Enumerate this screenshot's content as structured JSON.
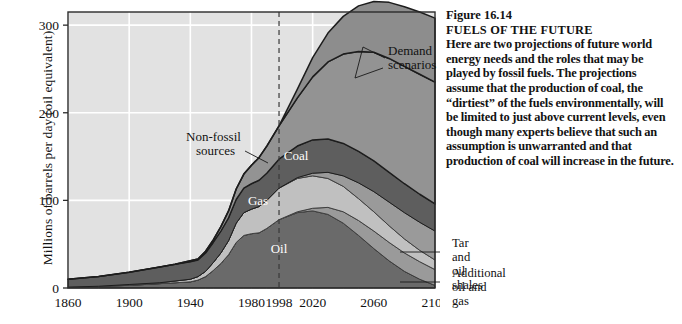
{
  "chart_data": {
    "type": "area",
    "title": "FUELS OF THE FUTURE",
    "figure_number": "Figure 16.14",
    "xlabel": "",
    "ylabel": "Millions of barrels per day (oil equivalent)",
    "xlim": [
      1860,
      2100
    ],
    "ylim": [
      0,
      315
    ],
    "yticks": [
      0,
      100,
      200,
      300
    ],
    "ytick_labels": [
      "0",
      "100",
      "200",
      "300"
    ],
    "xticks": [
      1860,
      1900,
      1940,
      1980,
      1998,
      2020,
      2060,
      2100
    ],
    "xtick_labels": [
      "1860",
      "1900",
      "1940",
      "1980",
      "1998",
      "2020",
      "2060",
      "2100"
    ],
    "grid": true,
    "grid_color": "#ffffff",
    "plot_background": "#e2e2e2",
    "present_year_marker": 1998,
    "present_marker_style": "dashed",
    "legend_position": "in-plot labels",
    "x": [
      1860,
      1880,
      1900,
      1920,
      1930,
      1940,
      1945,
      1950,
      1955,
      1960,
      1965,
      1970,
      1975,
      1980,
      1985,
      1990,
      1998,
      2010,
      2020,
      2030,
      2040,
      2050,
      2060,
      2070,
      2080,
      2090,
      2100
    ],
    "series": [
      {
        "name": "Oil",
        "color": "#6a6a6a",
        "label_in_plot": "Oil",
        "values": [
          1,
          2,
          3,
          5,
          6,
          7,
          9,
          13,
          20,
          28,
          38,
          52,
          60,
          62,
          63,
          68,
          78,
          86,
          88,
          84,
          74,
          60,
          45,
          31,
          19,
          10,
          3
        ]
      },
      {
        "name": "Additional oil and gas",
        "color": "#9a9a9a",
        "label_in_plot": "",
        "annotation": "Additional oil and gas",
        "values": [
          0,
          0,
          0,
          0,
          0,
          0,
          0,
          0,
          0,
          0,
          0,
          0,
          0,
          0,
          0,
          0,
          0,
          1,
          3,
          8,
          13,
          17,
          20,
          21,
          21,
          20,
          18
        ]
      },
      {
        "name": "Gas",
        "color": "#c0c0c0",
        "label_in_plot": "Gas",
        "values": [
          0,
          0,
          1,
          1,
          2,
          3,
          4,
          6,
          9,
          12,
          16,
          22,
          26,
          28,
          30,
          32,
          36,
          38,
          37,
          33,
          29,
          25,
          22,
          19,
          16,
          13,
          11
        ]
      },
      {
        "name": "Tar and oil shales",
        "color": "#9a9a9a",
        "label_in_plot": "",
        "annotation": "Tar and oil shales",
        "values": [
          0,
          0,
          0,
          0,
          0,
          0,
          0,
          0,
          0,
          0,
          0,
          0,
          0,
          0,
          0,
          0,
          0,
          1,
          3,
          7,
          12,
          18,
          23,
          27,
          30,
          32,
          33
        ]
      },
      {
        "name": "Coal",
        "color": "#5e5e5e",
        "label_in_plot": "Coal",
        "values": [
          9,
          11,
          14,
          18,
          19,
          20,
          19,
          21,
          23,
          25,
          26,
          27,
          28,
          29,
          30,
          31,
          33,
          36,
          38,
          38,
          37,
          36,
          35,
          34,
          33,
          32,
          31
        ]
      },
      {
        "name": "Non-fossil sources",
        "color": "#939393",
        "label_in_plot": "",
        "annotation": "Non-fossil sources",
        "values": [
          0,
          0,
          0,
          0,
          0,
          1,
          1,
          2,
          3,
          5,
          8,
          12,
          16,
          21,
          26,
          31,
          38,
          55,
          72,
          88,
          102,
          114,
          124,
          130,
          134,
          137,
          139
        ]
      },
      {
        "name": "Demand scenarios (upper band)",
        "color": "#8d8d8d",
        "label_in_plot": "",
        "annotation": "Demand scenarios",
        "values": [
          0,
          0,
          0,
          0,
          0,
          0,
          0,
          0,
          0,
          0,
          0,
          0,
          0,
          0,
          0,
          0,
          0,
          10,
          22,
          33,
          43,
          52,
          58,
          64,
          68,
          71,
          73
        ]
      }
    ],
    "annotations": [
      {
        "text": "Demand scenarios",
        "x": 0.855,
        "y": 0.14
      },
      {
        "text": "Non-fossil sources",
        "x": 0.44,
        "y": 0.46
      },
      {
        "text": "Coal",
        "x": 0.66,
        "y": 0.58
      },
      {
        "text": "Gas",
        "x": 0.58,
        "y": 0.7
      },
      {
        "text": "Oil",
        "x": 0.63,
        "y": 0.84
      },
      {
        "text": "Tar and oil shales",
        "x": 1.02,
        "y": 0.8
      },
      {
        "text": "Additional oil and gas",
        "x": 1.02,
        "y": 0.9
      }
    ]
  },
  "axis": {
    "ylabel": "Millions of barrels per day (oil equivalent)",
    "ytick_labels": [
      "300",
      "200",
      "100",
      "0"
    ],
    "xtick_labels": [
      "1860",
      "1900",
      "1940",
      "1980",
      "1998",
      "2020",
      "2060",
      "2100"
    ]
  },
  "plot_labels": {
    "demand_scenarios_line1": "Demand",
    "demand_scenarios_line2": "scenarios",
    "nonfossil_line1": "Non-fossil",
    "nonfossil_line2": "sources",
    "coal": "Coal",
    "gas": "Gas",
    "oil": "Oil"
  },
  "side_annotations": {
    "tar_line1": "Tar and",
    "tar_line2": "oil shales",
    "additional_line1": "Additional",
    "additional_line2": "oil and gas"
  },
  "caption": {
    "figure_number": "Figure 16.14",
    "title": "FUELS OF THE FUTURE",
    "body": "Here are two projections of future world energy needs and the roles that may be played by fossil fuels. The projections assume that the production of coal, the “dirtiest” of the fuels environmentally, will be limited to just above current levels, even though many experts believe that such an assumption is unwarranted and that production of coal will increase in the future."
  }
}
